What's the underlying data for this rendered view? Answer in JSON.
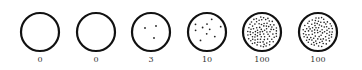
{
  "figure": {
    "background": "#ffffff",
    "stroke_color": "#111111",
    "dot_color": "#222222",
    "circles": [
      {
        "cx": 40,
        "cy": 32,
        "r": 19,
        "count_label": "0",
        "dots": 0
      },
      {
        "cx": 96,
        "cy": 32,
        "r": 19,
        "count_label": "0",
        "dots": 0
      },
      {
        "cx": 151,
        "cy": 32,
        "r": 19,
        "count_label": "3",
        "dots": 3
      },
      {
        "cx": 207,
        "cy": 32,
        "r": 19,
        "count_label": "10",
        "dots": 10
      },
      {
        "cx": 262,
        "cy": 32,
        "r": 19,
        "count_label": "100",
        "dots": 100
      },
      {
        "cx": 318,
        "cy": 32,
        "r": 19,
        "count_label": "100",
        "dots": 100
      }
    ]
  }
}
